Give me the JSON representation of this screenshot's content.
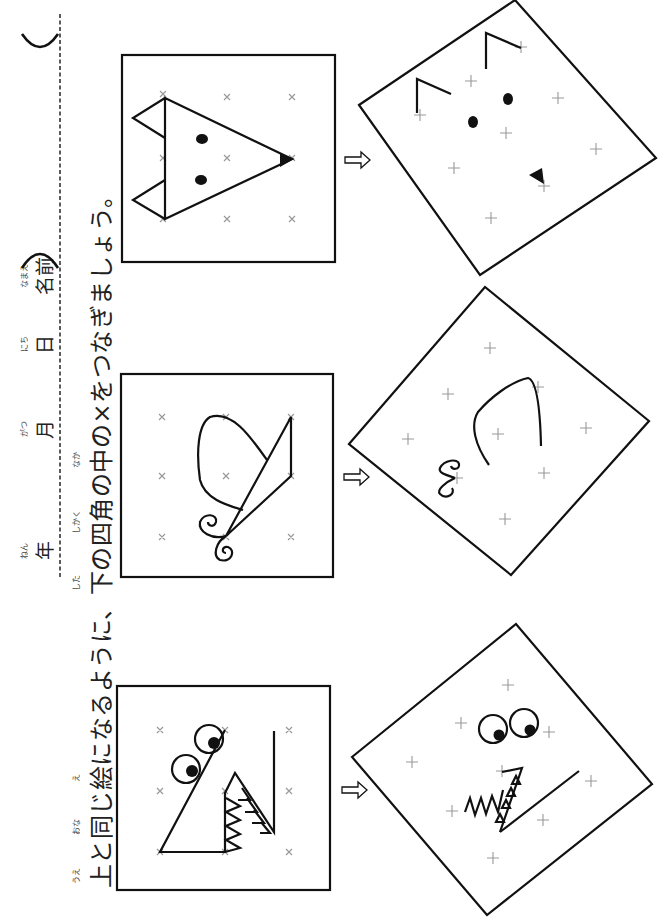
{
  "header": {
    "fields": [
      {
        "label": "年",
        "ruby": "ねん"
      },
      {
        "label": "月",
        "ruby": "がつ"
      },
      {
        "label": "日",
        "ruby": "にち"
      },
      {
        "label": "名前",
        "ruby": "なまえ"
      }
    ],
    "paren_open": "(",
    "paren_close": ")"
  },
  "instruction": {
    "segments": [
      {
        "text": "上",
        "ruby": "うえ"
      },
      {
        "text": "と"
      },
      {
        "text": "同",
        "ruby": "おな"
      },
      {
        "text": "じ"
      },
      {
        "text": "絵",
        "ruby": "え"
      },
      {
        "text": "になるように、"
      },
      {
        "text": "下",
        "ruby": "した"
      },
      {
        "text": "の"
      },
      {
        "text": "四角",
        "ruby": "しかく"
      },
      {
        "text": "の"
      },
      {
        "text": "中",
        "ruby": "なか"
      },
      {
        "text": "の×をつなぎましょう。"
      }
    ]
  },
  "puzzles": [
    {
      "name": "fox",
      "example": "fox-face-drawing",
      "target": "rotated-grid-fox"
    },
    {
      "name": "butterfly",
      "example": "butterfly-drawing",
      "target": "rotated-grid-butterfly"
    },
    {
      "name": "monster",
      "example": "monster-face-drawing",
      "target": "rotated-grid-monster"
    }
  ],
  "grid_marker": "×",
  "arrow_icon": "hollow-right-arrow",
  "colors": {
    "line": "#1a1a1a",
    "marker": "#999999",
    "dash": "#333333"
  }
}
